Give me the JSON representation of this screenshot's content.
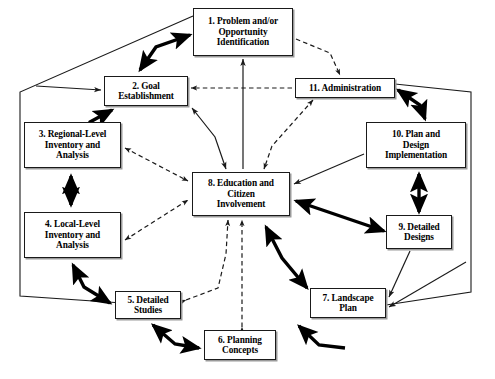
{
  "diagram": {
    "type": "flow-diagram",
    "canvas": {
      "width": 495,
      "height": 379
    },
    "style": {
      "background": "#ffffff",
      "box_border": "#1a1a1a",
      "box_shadow": "#9a9a9a",
      "text_color": "#000000",
      "bold_arrow": "#000000",
      "thin_arrow": "#1a1a1a",
      "dashed_arrow": "#1a1a1a",
      "outer_polygon": "#1a1a1a"
    },
    "nodes": [
      {
        "id": "n1",
        "number": "1.",
        "label": "1. Problem and/or\nOpportunity\nIdentification"
      },
      {
        "id": "n2",
        "number": "2.",
        "label": "2. Goal\nEstablishment"
      },
      {
        "id": "n3",
        "number": "3.",
        "label": "3. Regional-Level\nInventory and\nAnalysis"
      },
      {
        "id": "n4",
        "number": "4.",
        "label": "4. Local-Level\nInventory and\nAnalysis"
      },
      {
        "id": "n5",
        "number": "5.",
        "label": "5. Detailed\nStudies"
      },
      {
        "id": "n6",
        "number": "6.",
        "label": "6. Planning\nConcepts"
      },
      {
        "id": "n7",
        "number": "7.",
        "label": "7. Landscape\nPlan"
      },
      {
        "id": "n8",
        "number": "8.",
        "label": "8. Education and\nCitizen\nInvolvement"
      },
      {
        "id": "n9",
        "number": "9.",
        "label": "9. Detailed\nDesigns"
      },
      {
        "id": "n10",
        "number": "10.",
        "label": "10. Plan and\nDesign\nImplementation"
      },
      {
        "id": "n11",
        "number": "11.",
        "label": "11. Administration"
      }
    ],
    "edges": [
      {
        "from": "n2",
        "to": "n1",
        "style": "bold",
        "heads": "double"
      },
      {
        "from": "n2",
        "to": "n3",
        "style": "bold",
        "heads": "double"
      },
      {
        "from": "n3",
        "to": "n4",
        "style": "bold",
        "heads": "double"
      },
      {
        "from": "n4",
        "to": "n5",
        "style": "bold",
        "heads": "double"
      },
      {
        "from": "n5",
        "to": "n6",
        "style": "bold",
        "heads": "double"
      },
      {
        "from": "n6",
        "to": "n7",
        "style": "bold",
        "heads": "single"
      },
      {
        "from": "n7",
        "to": "n8",
        "style": "bold",
        "heads": "double"
      },
      {
        "from": "n8",
        "to": "n9",
        "style": "bold",
        "heads": "double"
      },
      {
        "from": "n9",
        "to": "n10",
        "style": "bold",
        "heads": "double"
      },
      {
        "from": "n10",
        "to": "n11",
        "style": "bold",
        "heads": "double"
      },
      {
        "from": "n8",
        "to": "n1",
        "style": "thin",
        "heads": "single"
      },
      {
        "from": "n2",
        "to": "n8",
        "style": "thin",
        "heads": "double"
      },
      {
        "from": "n11",
        "to": "n8",
        "style": "dashed",
        "heads": "double"
      },
      {
        "from": "n11",
        "to": "n2",
        "style": "dashed",
        "heads": "single"
      },
      {
        "from": "n1",
        "to": "n11",
        "style": "dashed",
        "heads": "single"
      },
      {
        "from": "n3",
        "to": "n8",
        "style": "dashed",
        "heads": "double"
      },
      {
        "from": "n4",
        "to": "n8",
        "style": "dashed",
        "heads": "double"
      },
      {
        "from": "n5",
        "to": "n8",
        "style": "dashed",
        "heads": "double"
      },
      {
        "from": "n6",
        "to": "n8",
        "style": "dashed",
        "heads": "double"
      },
      {
        "from": "n10",
        "to": "n8",
        "style": "thin",
        "heads": "single"
      },
      {
        "from": "n9",
        "to": "n7",
        "style": "thin",
        "heads": "single"
      },
      {
        "from": "outer-polygon",
        "to": "n2",
        "style": "thin",
        "heads": "single"
      },
      {
        "from": "outer-polygon",
        "to": "n7",
        "style": "thin",
        "heads": "single"
      },
      {
        "from": "n1",
        "to": "outer-polygon",
        "style": "thin",
        "heads": "none"
      },
      {
        "from": "n5",
        "to": "outer-polygon",
        "style": "thin",
        "heads": "none"
      }
    ]
  }
}
